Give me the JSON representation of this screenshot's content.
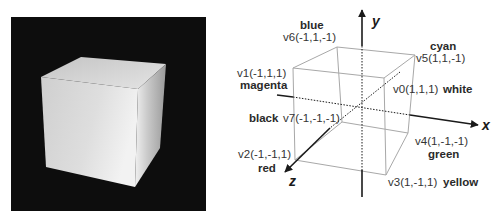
{
  "figure": {
    "left_panel": {
      "description": "Rendered shaded cube on black background",
      "background_color": "#0d0d0d",
      "cube_color": "#d9d9d9"
    },
    "right_panel": {
      "axes": {
        "x_label": "x",
        "y_label": "y",
        "z_label": "z"
      },
      "vertices": [
        {
          "id": "v0",
          "label": "v0(1,1,1)",
          "color_name": "white"
        },
        {
          "id": "v1",
          "label": "v1(-1,1,1)",
          "color_name": "magenta"
        },
        {
          "id": "v2",
          "label": "v2(-1,-1,1)",
          "color_name": "red"
        },
        {
          "id": "v3",
          "label": "v3(1,-1,1)",
          "color_name": "yellow"
        },
        {
          "id": "v4",
          "label": "v4(1,-1,-1)",
          "color_name": "green"
        },
        {
          "id": "v5",
          "label": "v5(1,1,-1)",
          "color_name": "cyan"
        },
        {
          "id": "v6",
          "label": "v6(-1,1,-1)",
          "color_name": "blue"
        },
        {
          "id": "v7",
          "label": "v7(-1,-1,-1)",
          "color_name": "black"
        }
      ],
      "colors": {
        "edge": "#a8a8a8",
        "axis": "#1a1a1a",
        "text": "#333333"
      }
    }
  }
}
